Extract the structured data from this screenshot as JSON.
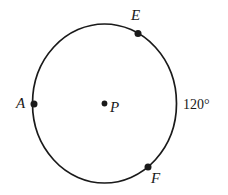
{
  "figure": {
    "type": "circle-diagram",
    "background_color": "#ffffff",
    "stroke_color": "#1a1a1a",
    "circle": {
      "name": "circle-P",
      "center_label": "P",
      "center_x": 104.5,
      "center_y": 103.5,
      "radius_x": 72,
      "radius_y": 79.5,
      "stroke_width": 1.6
    },
    "center_point": {
      "name": "point-P",
      "label": "P",
      "x": 104.5,
      "y": 103.5,
      "dot_radius": 3
    },
    "points": [
      {
        "name": "point-A",
        "label": "A",
        "x": 34,
        "y": 104,
        "dot_radius": 3.4,
        "label_position": "left"
      },
      {
        "name": "point-E",
        "label": "E",
        "x": 138,
        "y": 33,
        "dot_radius": 3.4,
        "label_position": "above"
      },
      {
        "name": "point-F",
        "label": "F",
        "x": 148,
        "y": 167,
        "dot_radius": 3.4,
        "label_position": "below-right"
      }
    ],
    "annotations": [
      {
        "name": "arc-measure-EF",
        "text": "120°",
        "x": 198,
        "y": 105,
        "describes": "arc from E to F on the right side of circle P"
      }
    ]
  }
}
